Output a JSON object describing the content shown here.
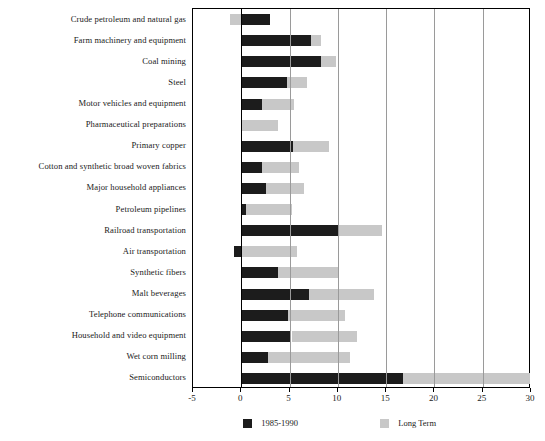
{
  "chart_data": {
    "type": "bar",
    "orientation": "horizontal",
    "title": "",
    "xlabel": "",
    "ylabel": "",
    "xlim": [
      -5,
      30
    ],
    "xticks": [
      -5,
      0,
      5,
      10,
      15,
      20,
      25,
      30
    ],
    "xticklabels": [
      "-5",
      "0",
      "5",
      "10",
      "15",
      "20",
      "25",
      "30"
    ],
    "grid": true,
    "grid_axis": "x",
    "legend_position": "bottom",
    "stacked": true,
    "categories": [
      "Crude petroleum and natural gas",
      "Farm machinery and equipment",
      "Coal mining",
      "Steel",
      "Motor vehicles and equipment",
      "Pharmaceutical preparations",
      "Primary copper",
      "Cotton and synthetic broad woven fabrics",
      "Major household appliances",
      "Petroleum pipelines",
      "Railroad transportation",
      "Air transportation",
      "Synthetic fibers",
      "Malt beverages",
      "Telephone communications",
      "Household and video equipment",
      "Wet corn milling",
      "Semiconductors"
    ],
    "series": [
      {
        "name": "1985-1990",
        "color": "#1c1c1c",
        "values": [
          3.0,
          7.2,
          8.3,
          4.7,
          2.1,
          0.0,
          5.4,
          2.1,
          2.6,
          0.5,
          10.1,
          -0.8,
          3.8,
          7.0,
          4.8,
          5.2,
          2.8,
          16.7
        ]
      },
      {
        "name": "Long Term",
        "color": "#c8c8c8",
        "values": [
          -1.2,
          1.1,
          1.5,
          2.1,
          3.4,
          3.8,
          3.7,
          3.9,
          3.9,
          4.8,
          4.5,
          5.8,
          6.2,
          6.7,
          5.9,
          6.8,
          8.5,
          13.2
        ]
      }
    ],
    "bar_segments": [
      {
        "category": "Crude petroleum and natural gas",
        "dark_start": 0.0,
        "dark_end": 3.0,
        "light_start": -1.2,
        "light_end": 0.0
      },
      {
        "category": "Farm machinery and equipment",
        "dark_start": 0.0,
        "dark_end": 7.2,
        "light_start": 7.2,
        "light_end": 8.3
      },
      {
        "category": "Coal mining",
        "dark_start": 0.0,
        "dark_end": 8.3,
        "light_start": 8.3,
        "light_end": 9.8
      },
      {
        "category": "Steel",
        "dark_start": 0.0,
        "dark_end": 4.7,
        "light_start": 4.7,
        "light_end": 6.8
      },
      {
        "category": "Motor vehicles and equipment",
        "dark_start": 0.0,
        "dark_end": 2.1,
        "light_start": 2.1,
        "light_end": 5.5
      },
      {
        "category": "Pharmaceutical preparations",
        "dark_start": 0.0,
        "dark_end": 0.0,
        "light_start": 0.0,
        "light_end": 3.8
      },
      {
        "category": "Primary copper",
        "dark_start": 0.0,
        "dark_end": 5.4,
        "light_start": 5.4,
        "light_end": 9.1
      },
      {
        "category": "Cotton and synthetic broad woven fabrics",
        "dark_start": 0.0,
        "dark_end": 2.1,
        "light_start": 2.1,
        "light_end": 6.0
      },
      {
        "category": "Major household appliances",
        "dark_start": 0.0,
        "dark_end": 2.6,
        "light_start": 2.6,
        "light_end": 6.5
      },
      {
        "category": "Petroleum pipelines",
        "dark_start": 0.0,
        "dark_end": 0.5,
        "light_start": 0.5,
        "light_end": 5.3
      },
      {
        "category": "Railroad transportation",
        "dark_start": 0.0,
        "dark_end": 10.1,
        "light_start": 10.1,
        "light_end": 14.6
      },
      {
        "category": "Air transportation",
        "dark_start": -0.8,
        "dark_end": 0.0,
        "light_start": 0.0,
        "light_end": 5.8
      },
      {
        "category": "Synthetic fibers",
        "dark_start": 0.0,
        "dark_end": 3.8,
        "light_start": 3.8,
        "light_end": 10.0
      },
      {
        "category": "Malt beverages",
        "dark_start": 0.0,
        "dark_end": 7.0,
        "light_start": 7.0,
        "light_end": 13.7
      },
      {
        "category": "Telephone communications",
        "dark_start": 0.0,
        "dark_end": 4.8,
        "light_start": 4.8,
        "light_end": 10.7
      },
      {
        "category": "Household and video equipment",
        "dark_start": 0.0,
        "dark_end": 5.2,
        "light_start": 5.2,
        "light_end": 12.0
      },
      {
        "category": "Wet corn milling",
        "dark_start": 0.0,
        "dark_end": 2.8,
        "light_start": 2.8,
        "light_end": 11.3
      },
      {
        "category": "Semiconductors",
        "dark_start": 0.0,
        "dark_end": 16.7,
        "light_start": 16.7,
        "light_end": 29.9
      }
    ],
    "legend": [
      {
        "label": "1985-1990",
        "color": "#1c1c1c"
      },
      {
        "label": "Long Term",
        "color": "#c8c8c8"
      }
    ]
  }
}
